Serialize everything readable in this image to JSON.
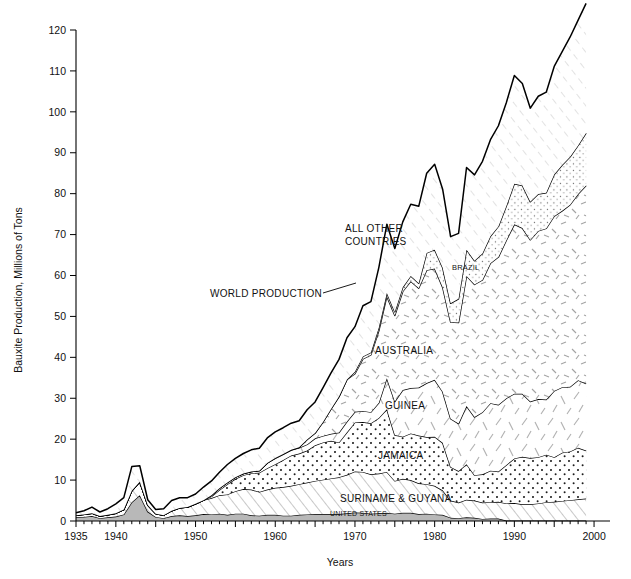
{
  "chart_data": {
    "type": "area",
    "title": "",
    "subtitle": "",
    "xlabel": "Years",
    "ylabel": "Bauxite Production, Millions of Tons",
    "xlim": [
      1935,
      2002
    ],
    "ylim": [
      0,
      120
    ],
    "ytick_step": 10,
    "xtick_major_step": 5,
    "xtick_minor_step": 1,
    "grid": false,
    "legend_position": "inline-annotations",
    "stacked": true,
    "x": [
      1935,
      1936,
      1937,
      1938,
      1939,
      1940,
      1941,
      1942,
      1943,
      1944,
      1945,
      1946,
      1947,
      1948,
      1949,
      1950,
      1951,
      1952,
      1953,
      1954,
      1955,
      1956,
      1957,
      1958,
      1959,
      1960,
      1961,
      1962,
      1963,
      1964,
      1965,
      1966,
      1967,
      1968,
      1969,
      1970,
      1971,
      1972,
      1973,
      1974,
      1975,
      1976,
      1977,
      1978,
      1979,
      1980,
      1981,
      1982,
      1983,
      1984,
      1985,
      1986,
      1987,
      1988,
      1989,
      1990,
      1991,
      1992,
      1993,
      1994,
      1995,
      1996,
      1997,
      1998,
      1999
    ],
    "ytick_labels": [
      "0",
      "10",
      "20",
      "30",
      "40",
      "50",
      "60",
      "70",
      "80",
      "90",
      "100",
      "110",
      "120"
    ],
    "xtick_labels": [
      "1935",
      "1940",
      "1950",
      "1960",
      "1970",
      "1980",
      "1990",
      "2000"
    ],
    "series": [
      {
        "name": "UNITED STATES",
        "fill": "solid-gray",
        "color": "#b8b8b8",
        "values": [
          0.9,
          1.0,
          1.2,
          0.7,
          0.9,
          1.1,
          1.6,
          4.6,
          6.3,
          2.3,
          1.0,
          0.7,
          1.2,
          1.4,
          1.2,
          1.4,
          1.7,
          1.6,
          1.8,
          1.5,
          1.8,
          1.8,
          1.4,
          1.3,
          1.5,
          1.5,
          1.3,
          1.3,
          1.5,
          1.6,
          1.7,
          1.7,
          1.7,
          1.7,
          1.9,
          2.1,
          2.0,
          1.8,
          1.9,
          2.0,
          1.8,
          2.0,
          2.0,
          1.7,
          1.8,
          1.6,
          1.5,
          0.8,
          0.7,
          0.9,
          0.8,
          0.5,
          0.6,
          0.6,
          0.1,
          0.1,
          0.1,
          0.1,
          0.1,
          0.1,
          0.1,
          0.1,
          0.1,
          0.1,
          0.1
        ]
      },
      {
        "name": "SURINAME & GUYANA",
        "fill": "diagonal-hatch",
        "color": "#ffffff",
        "values": [
          0.5,
          0.6,
          0.7,
          0.5,
          0.6,
          0.8,
          1.2,
          2.8,
          3.3,
          1.6,
          0.8,
          0.7,
          1.3,
          1.8,
          2.2,
          2.8,
          3.4,
          4.0,
          4.5,
          5.0,
          5.5,
          6.0,
          6.3,
          5.8,
          6.2,
          6.6,
          7.0,
          7.3,
          7.5,
          7.8,
          8.1,
          8.4,
          8.7,
          9.0,
          9.4,
          10.0,
          10.0,
          9.6,
          9.7,
          10.0,
          8.0,
          8.3,
          8.0,
          7.5,
          7.2,
          7.0,
          6.0,
          4.2,
          3.8,
          4.3,
          4.2,
          4.0,
          4.0,
          4.1,
          4.2,
          4.3,
          4.0,
          4.0,
          4.2,
          4.5,
          4.6,
          4.8,
          5.0,
          5.2,
          5.4
        ]
      },
      {
        "name": "JAMAICA",
        "fill": "dots",
        "color": "#ffffff",
        "values": [
          0,
          0,
          0,
          0,
          0,
          0,
          0,
          0,
          0,
          0,
          0,
          0,
          0,
          0,
          0,
          0,
          0,
          0.4,
          1.3,
          2.5,
          3.0,
          3.4,
          4.0,
          4.7,
          5.2,
          5.8,
          6.6,
          7.4,
          7.5,
          7.8,
          8.7,
          9.1,
          9.2,
          8.5,
          10.4,
          12.0,
          12.2,
          12.5,
          13.6,
          15.3,
          11.2,
          10.3,
          11.4,
          11.7,
          11.5,
          12.0,
          11.6,
          8.2,
          7.7,
          8.7,
          6.2,
          6.9,
          7.7,
          7.4,
          9.4,
          10.9,
          11.6,
          11.3,
          11.3,
          11.6,
          10.9,
          11.8,
          11.9,
          12.6,
          11.7
        ]
      },
      {
        "name": "GUINEA",
        "fill": "sparse-dashes",
        "color": "#ffffff",
        "values": [
          0,
          0,
          0,
          0,
          0,
          0,
          0,
          0,
          0,
          0,
          0,
          0,
          0,
          0,
          0,
          0,
          0,
          0.3,
          0.4,
          0.4,
          0.4,
          0.4,
          0.4,
          0.5,
          1.3,
          1.4,
          1.4,
          1.3,
          1.4,
          1.5,
          1.7,
          1.6,
          1.7,
          2.4,
          2.6,
          2.6,
          2.7,
          2.7,
          3.7,
          7.6,
          8.2,
          11.4,
          11.1,
          11.7,
          13.2,
          13.9,
          12.5,
          11.8,
          11.6,
          14.2,
          14.2,
          15.2,
          16.5,
          16.3,
          16.3,
          15.8,
          15.4,
          13.8,
          14.2,
          13.5,
          16.2,
          16.0,
          15.8,
          16.5,
          16.4
        ]
      },
      {
        "name": "AUSTRALIA",
        "fill": "dashes",
        "color": "#ffffff",
        "values": [
          0,
          0,
          0,
          0,
          0,
          0,
          0,
          0,
          0,
          0,
          0,
          0,
          0,
          0,
          0,
          0,
          0,
          0,
          0,
          0,
          0,
          0,
          0,
          0,
          0,
          0.1,
          0.1,
          0.1,
          0.1,
          1.2,
          1.3,
          3.4,
          6.1,
          8.8,
          10.3,
          9.3,
          12.7,
          14.0,
          17.6,
          20.0,
          21.0,
          24.1,
          26.1,
          24.3,
          27.6,
          27.2,
          25.5,
          23.6,
          24.7,
          31.8,
          32.4,
          32.3,
          34.2,
          36.1,
          38.6,
          41.4,
          40.5,
          39.5,
          41.1,
          41.8,
          42.7,
          43.1,
          44.5,
          45.5,
          48.4
        ]
      },
      {
        "name": "BRAZIL",
        "fill": "fine-dots",
        "color": "#ffffff",
        "values": [
          0,
          0,
          0,
          0,
          0,
          0,
          0,
          0,
          0,
          0,
          0,
          0,
          0,
          0,
          0,
          0,
          0,
          0,
          0,
          0,
          0,
          0,
          0,
          0,
          0,
          0,
          0,
          0,
          0,
          0,
          0,
          0,
          0,
          0,
          0,
          0.5,
          0.6,
          0.6,
          0.8,
          0.8,
          0.9,
          1.0,
          1.3,
          1.2,
          4.2,
          4.6,
          4.8,
          4.6,
          5.8,
          6.4,
          5.8,
          6.5,
          6.6,
          7.5,
          8.4,
          9.9,
          10.4,
          9.3,
          9.0,
          8.7,
          10.2,
          11.2,
          11.7,
          11.9,
          12.8
        ]
      },
      {
        "name": "ALL OTHER COUNTRIES",
        "fill": "light-diagonal-hatch",
        "color": "#ffffff",
        "values": [
          0.6,
          0.9,
          1.5,
          1.0,
          1.5,
          2.3,
          2.9,
          5.9,
          3.9,
          1.3,
          1.0,
          1.6,
          2.5,
          2.5,
          2.3,
          2.4,
          3.2,
          3.5,
          3.9,
          4.4,
          4.6,
          4.9,
          5.3,
          5.5,
          6.1,
          6.4,
          6.4,
          6.5,
          6.5,
          7.3,
          7.6,
          8.4,
          8.8,
          9.1,
          10.2,
          11.0,
          12.4,
          12.4,
          14.7,
          16.8,
          15.5,
          16.0,
          17.5,
          18.8,
          19.5,
          20.9,
          19.2,
          16.3,
          16.0,
          20.1,
          21.0,
          22.5,
          23.6,
          24.6,
          25.3,
          26.5,
          24.9,
          22.9,
          23.9,
          24.6,
          26.4,
          27.7,
          29.3,
          30.6,
          31.7
        ]
      }
    ],
    "total_label": "WORLD PRODUCTION",
    "total_values": [
      2.0,
      2.5,
      3.4,
      2.2,
      3.0,
      4.2,
      5.7,
      13.3,
      13.5,
      5.2,
      2.8,
      3.0,
      5.0,
      5.7,
      5.7,
      6.6,
      8.3,
      9.8,
      11.9,
      14.3,
      15.3,
      16.5,
      17.4,
      17.8,
      20.3,
      21.8,
      22.8,
      23.9,
      24.5,
      27.2,
      29.1,
      32.6,
      36.2,
      39.5,
      44.8,
      47.5,
      50.6,
      53.6,
      62.0,
      72.5,
      66.6,
      73.1,
      77.4,
      76.9,
      85.0,
      87.2,
      81.1,
      69.5,
      70.3,
      86.4,
      84.6,
      87.9,
      93.2,
      96.6,
      102.3,
      106.9,
      106.9,
      100.9,
      103.8,
      104.8,
      111.1,
      114.7,
      118.3,
      122.4,
      126.5
    ],
    "annotations": [
      {
        "label": "WORLD PRODUCTION",
        "x": 210,
        "y": 297,
        "leader": true
      },
      {
        "label": "ALL OTHER COUNTRIES",
        "x": 345,
        "y": 232,
        "leader": false
      },
      {
        "label": "BRAZIL",
        "x": 452,
        "y": 270,
        "leader": false
      },
      {
        "label": "AUSTRALIA",
        "x": 375,
        "y": 354,
        "leader": false
      },
      {
        "label": "GUINEA",
        "x": 385,
        "y": 409,
        "leader": false
      },
      {
        "label": "JAMAICA",
        "x": 378,
        "y": 459,
        "leader": false
      },
      {
        "label": "SURINAME & GUYANA",
        "x": 340,
        "y": 502,
        "leader": false
      },
      {
        "label": "UNITED STATES",
        "x": 330,
        "y": 516,
        "leader": false
      }
    ]
  },
  "axes": {
    "y_title": "Bauxite Production, Millions of Tons",
    "x_title": "Years"
  }
}
